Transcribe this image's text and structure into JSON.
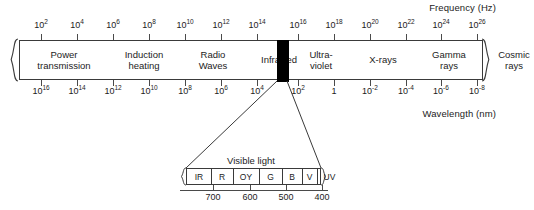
{
  "chart_data": {
    "type": "diagram",
    "axes": {
      "frequency": {
        "label": "Frequency (Hz)",
        "unit": "Hz",
        "tick_labels": [
          "10^2",
          "10^4",
          "10^6",
          "10^8",
          "10^10",
          "10^12",
          "10^14",
          "10^16",
          "10^18",
          "10^20",
          "10^22",
          "10^24",
          "10^26"
        ],
        "position": "top"
      },
      "wavelength": {
        "label": "Wavelength (nm)",
        "unit": "nm",
        "tick_labels": [
          "10^16",
          "10^14",
          "10^12",
          "10^10",
          "10^8",
          "10^6",
          "10^4",
          "10^2",
          "1",
          "10^-2",
          "10^-4",
          "10^-6",
          "10^-8"
        ],
        "position": "bottom"
      }
    },
    "bands": [
      {
        "name": "Power transmission",
        "lines": [
          "Power",
          "transmission"
        ]
      },
      {
        "name": "Induction heating",
        "lines": [
          "Induction",
          "heating"
        ]
      },
      {
        "name": "Radio Waves",
        "lines": [
          "Radio",
          "Waves"
        ]
      },
      {
        "name": "Infra-red",
        "lines": [
          "Infra-red"
        ]
      },
      {
        "name": "Visible light",
        "lines": [],
        "marker": "black"
      },
      {
        "name": "Ultra-violet",
        "lines": [
          "Ultra-",
          "violet"
        ]
      },
      {
        "name": "X-rays",
        "lines": [
          "X-rays"
        ]
      },
      {
        "name": "Gamma rays",
        "lines": [
          "Gamma",
          "rays"
        ]
      },
      {
        "name": "Cosmic rays",
        "lines": [
          "Cosmic",
          "rays"
        ]
      }
    ],
    "inset": {
      "title": "Visible light",
      "bands": [
        "IR",
        "R",
        "OY",
        "G",
        "B",
        "V",
        "UV"
      ],
      "tick_labels": [
        "700",
        "600",
        "500",
        "400"
      ],
      "tick_unit": "nm"
    }
  },
  "frequency_axis": {
    "title": "Frequency (Hz)",
    "ticks": [
      {
        "base": "10",
        "exp": "2",
        "x": 41
      },
      {
        "base": "10",
        "exp": "4",
        "x": 77
      },
      {
        "base": "10",
        "exp": "6",
        "x": 113
      },
      {
        "base": "10",
        "exp": "8",
        "x": 149
      },
      {
        "base": "10",
        "exp": "10",
        "x": 185
      },
      {
        "base": "10",
        "exp": "12",
        "x": 221
      },
      {
        "base": "10",
        "exp": "14",
        "x": 257
      },
      {
        "base": "10",
        "exp": "16",
        "x": 298
      },
      {
        "base": "10",
        "exp": "18",
        "x": 334
      },
      {
        "base": "10",
        "exp": "20",
        "x": 370
      },
      {
        "base": "10",
        "exp": "22",
        "x": 406
      },
      {
        "base": "10",
        "exp": "24",
        "x": 441
      },
      {
        "base": "10",
        "exp": "26",
        "x": 477
      }
    ]
  },
  "wavelength_axis": {
    "title": "Wavelength (nm)",
    "ticks": [
      {
        "base": "10",
        "exp": "16",
        "x": 41
      },
      {
        "base": "10",
        "exp": "14",
        "x": 77
      },
      {
        "base": "10",
        "exp": "12",
        "x": 113
      },
      {
        "base": "10",
        "exp": "10",
        "x": 149
      },
      {
        "base": "10",
        "exp": "8",
        "x": 185
      },
      {
        "base": "10",
        "exp": "6",
        "x": 221
      },
      {
        "base": "10",
        "exp": "4",
        "x": 257
      },
      {
        "base": "10",
        "exp": "2",
        "x": 298
      },
      {
        "base": "1",
        "exp": "",
        "x": 334
      },
      {
        "base": "10",
        "exp": "-2",
        "x": 370
      },
      {
        "base": "10",
        "exp": "-4",
        "x": 406
      },
      {
        "base": "10",
        "exp": "-6",
        "x": 441
      },
      {
        "base": "10",
        "exp": "-8",
        "x": 477
      }
    ]
  },
  "spectrum_bands": [
    {
      "id": "power-transmission",
      "line1": "Power",
      "line2": "transmission",
      "left": 0,
      "width": 85
    },
    {
      "id": "induction-heating",
      "line1": "Induction",
      "line2": "heating",
      "left": 85,
      "width": 73
    },
    {
      "id": "radio-waves",
      "line1": "Radio",
      "line2": "Waves",
      "left": 158,
      "width": 68
    },
    {
      "id": "infra-red",
      "line1": "Infra-red",
      "line2": "",
      "left": 226,
      "width": 69
    },
    {
      "id": "ultra-violet",
      "line1": "Ultra-",
      "line2": "violet",
      "left": 308,
      "width": 60
    },
    {
      "id": "x-rays",
      "line1": "X-rays",
      "line2": "",
      "left": 368,
      "width": 64
    },
    {
      "id": "gamma-rays",
      "line1": "Gamma",
      "line2": "rays",
      "left": 355,
      "width": 0
    },
    {
      "id": "cosmic-rays",
      "line1": "Cosmic",
      "line2": "rays",
      "left": 420,
      "width": 0
    }
  ],
  "visible_marker": {
    "label": "Visible light band marker",
    "color": "#000000",
    "left": 276,
    "width": 12
  },
  "visible_inset": {
    "title": "Visible light",
    "bands": [
      {
        "id": "ir",
        "label": "IR",
        "left": 0,
        "width": 24
      },
      {
        "id": "r",
        "label": "R",
        "left": 24,
        "width": 22
      },
      {
        "id": "oy",
        "label": "OY",
        "left": 46,
        "width": 26
      },
      {
        "id": "g",
        "label": "G",
        "left": 72,
        "width": 23
      },
      {
        "id": "b",
        "label": "B",
        "left": 95,
        "width": 20
      },
      {
        "id": "v",
        "label": "V",
        "left": 115,
        "width": 15
      },
      {
        "id": "uv",
        "label": "UV",
        "left": 130,
        "width": 25
      }
    ],
    "separators": [
      24,
      46,
      72,
      95,
      115,
      130
    ],
    "ticks": [
      {
        "label": "700",
        "x": 213
      },
      {
        "label": "600",
        "x": 250
      },
      {
        "label": "500",
        "x": 286
      },
      {
        "label": "400",
        "x": 322
      }
    ]
  }
}
